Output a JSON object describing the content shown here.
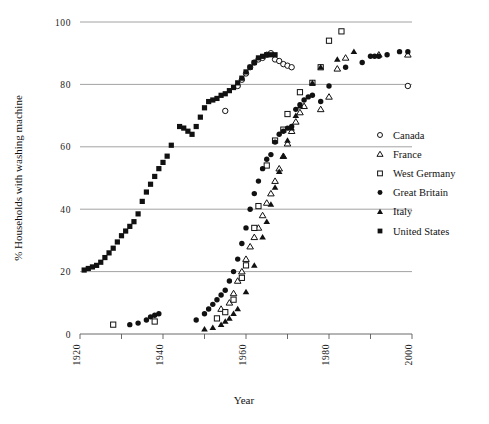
{
  "chart_data": {
    "type": "scatter",
    "title": "",
    "xlabel": "Year",
    "ylabel": "% Households with washing machine",
    "xlim": [
      1920,
      2000
    ],
    "ylim": [
      0,
      100
    ],
    "xticks": [
      1920,
      1940,
      1960,
      1980,
      2000
    ],
    "xtick_labels": [
      "1920",
      "1940",
      "1960",
      "1980",
      "2000"
    ],
    "yticks": [
      0,
      20,
      40,
      60,
      80,
      100
    ],
    "ytick_labels": [
      "0",
      "20",
      "40",
      "60",
      "80",
      "100"
    ],
    "grid": "horizontal",
    "legend_position": "right-middle",
    "series": [
      {
        "name": "Canada",
        "marker": "open-circle",
        "color": "#111111",
        "points": [
          [
            1955,
            71.5
          ],
          [
            1958,
            79.5
          ],
          [
            1959,
            81.5
          ],
          [
            1960,
            83.5
          ],
          [
            1961,
            85.5
          ],
          [
            1962,
            87.0
          ],
          [
            1963,
            88.0
          ],
          [
            1964,
            88.5
          ],
          [
            1965,
            89.5
          ],
          [
            1966,
            90.0
          ],
          [
            1967,
            88.0
          ],
          [
            1968,
            87.5
          ],
          [
            1969,
            86.5
          ],
          [
            1970,
            86.0
          ],
          [
            1971,
            85.5
          ],
          [
            1999,
            79.5
          ]
        ]
      },
      {
        "name": "France",
        "marker": "open-triangle",
        "color": "#111111",
        "points": [
          [
            1954,
            8.0
          ],
          [
            1956,
            10.0
          ],
          [
            1957,
            13.0
          ],
          [
            1958,
            17.0
          ],
          [
            1959,
            20.0
          ],
          [
            1960,
            24.0
          ],
          [
            1961,
            28.0
          ],
          [
            1962,
            31.0
          ],
          [
            1963,
            34.0
          ],
          [
            1964,
            38.0
          ],
          [
            1965,
            42.0
          ],
          [
            1966,
            45.0
          ],
          [
            1967,
            49.0
          ],
          [
            1968,
            53.0
          ],
          [
            1969,
            57.0
          ],
          [
            1970,
            61.0
          ],
          [
            1971,
            65.0
          ],
          [
            1972,
            68.0
          ],
          [
            1973,
            71.0
          ],
          [
            1974,
            73.0
          ],
          [
            1978,
            72.0
          ],
          [
            1980,
            76.0
          ],
          [
            1982,
            85.0
          ],
          [
            1984,
            88.5
          ],
          [
            1992,
            89.5
          ],
          [
            1999,
            89.5
          ]
        ]
      },
      {
        "name": "West Germany",
        "marker": "open-square",
        "color": "#111111",
        "points": [
          [
            1928,
            3.0
          ],
          [
            1938,
            4.0
          ],
          [
            1953,
            5.0
          ],
          [
            1955,
            7.0
          ],
          [
            1957,
            11.0
          ],
          [
            1959,
            18.0
          ],
          [
            1960,
            22.0
          ],
          [
            1962,
            34.0
          ],
          [
            1963,
            41.0
          ],
          [
            1965,
            54.0
          ],
          [
            1967,
            62.0
          ],
          [
            1969,
            65.5
          ],
          [
            1970,
            70.5
          ],
          [
            1973,
            77.5
          ],
          [
            1976,
            80.5
          ],
          [
            1978,
            85.5
          ],
          [
            1980,
            94.0
          ],
          [
            1983,
            97.0
          ]
        ]
      },
      {
        "name": "Great Britain",
        "marker": "filled-circle",
        "color": "#111111",
        "points": [
          [
            1932,
            3.0
          ],
          [
            1934,
            3.5
          ],
          [
            1936,
            4.5
          ],
          [
            1937,
            5.5
          ],
          [
            1938,
            6.0
          ],
          [
            1939,
            6.5
          ],
          [
            1948,
            4.5
          ],
          [
            1950,
            6.5
          ],
          [
            1951,
            8.0
          ],
          [
            1952,
            9.5
          ],
          [
            1953,
            11.0
          ],
          [
            1954,
            12.5
          ],
          [
            1955,
            14.0
          ],
          [
            1956,
            17.0
          ],
          [
            1957,
            20.0
          ],
          [
            1958,
            24.0
          ],
          [
            1959,
            29.0
          ],
          [
            1960,
            34.0
          ],
          [
            1961,
            40.0
          ],
          [
            1962,
            45.0
          ],
          [
            1963,
            49.0
          ],
          [
            1964,
            53.0
          ],
          [
            1965,
            56.0
          ],
          [
            1966,
            57.5
          ],
          [
            1967,
            61.5
          ],
          [
            1968,
            64.0
          ],
          [
            1969,
            65.0
          ],
          [
            1970,
            66.0
          ],
          [
            1971,
            66.5
          ],
          [
            1972,
            72.0
          ],
          [
            1973,
            73.5
          ],
          [
            1974,
            75.0
          ],
          [
            1975,
            76.0
          ],
          [
            1976,
            76.5
          ],
          [
            1978,
            74.5
          ],
          [
            1980,
            79.5
          ],
          [
            1984,
            85.5
          ],
          [
            1988,
            87.0
          ],
          [
            1990,
            89.0
          ],
          [
            1991,
            89.0
          ],
          [
            1992,
            89.0
          ],
          [
            1994,
            89.5
          ],
          [
            1997,
            90.5
          ],
          [
            1999,
            90.5
          ]
        ]
      },
      {
        "name": "Italy",
        "marker": "filled-triangle",
        "color": "#111111",
        "points": [
          [
            1950,
            1.5
          ],
          [
            1952,
            2.0
          ],
          [
            1954,
            3.0
          ],
          [
            1955,
            4.0
          ],
          [
            1956,
            5.0
          ],
          [
            1957,
            6.5
          ],
          [
            1958,
            8.0
          ],
          [
            1960,
            13.5
          ],
          [
            1962,
            22.0
          ],
          [
            1964,
            31.0
          ],
          [
            1965,
            36.0
          ],
          [
            1966,
            41.5
          ],
          [
            1967,
            47.0
          ],
          [
            1968,
            52.0
          ],
          [
            1969,
            57.0
          ],
          [
            1970,
            62.0
          ],
          [
            1971,
            66.0
          ],
          [
            1972,
            70.0
          ],
          [
            1973,
            73.0
          ],
          [
            1976,
            80.5
          ],
          [
            1978,
            85.5
          ],
          [
            1982,
            88.0
          ],
          [
            1986,
            90.5
          ]
        ]
      },
      {
        "name": "United States",
        "marker": "filled-square",
        "color": "#111111",
        "points": [
          [
            1921,
            20.5
          ],
          [
            1922,
            21.0
          ],
          [
            1923,
            21.5
          ],
          [
            1924,
            22.0
          ],
          [
            1925,
            23.0
          ],
          [
            1926,
            24.5
          ],
          [
            1927,
            26.0
          ],
          [
            1928,
            27.5
          ],
          [
            1929,
            29.5
          ],
          [
            1930,
            31.5
          ],
          [
            1931,
            33.0
          ],
          [
            1932,
            34.5
          ],
          [
            1933,
            36.0
          ],
          [
            1934,
            38.5
          ],
          [
            1935,
            42.5
          ],
          [
            1936,
            45.5
          ],
          [
            1937,
            48.0
          ],
          [
            1938,
            50.5
          ],
          [
            1939,
            53.0
          ],
          [
            1940,
            55.0
          ],
          [
            1941,
            57.0
          ],
          [
            1942,
            60.5
          ],
          [
            1944,
            66.5
          ],
          [
            1945,
            66.0
          ],
          [
            1946,
            65.0
          ],
          [
            1947,
            64.0
          ],
          [
            1948,
            66.5
          ],
          [
            1949,
            69.5
          ],
          [
            1950,
            72.5
          ],
          [
            1951,
            74.5
          ],
          [
            1952,
            75.0
          ],
          [
            1953,
            75.5
          ],
          [
            1954,
            76.5
          ],
          [
            1955,
            77.0
          ],
          [
            1956,
            78.0
          ],
          [
            1957,
            79.0
          ],
          [
            1958,
            80.5
          ],
          [
            1959,
            82.0
          ],
          [
            1960,
            84.0
          ],
          [
            1961,
            85.5
          ],
          [
            1962,
            87.0
          ],
          [
            1963,
            88.5
          ],
          [
            1964,
            89.0
          ],
          [
            1965,
            89.5
          ],
          [
            1966,
            89.5
          ],
          [
            1967,
            89.5
          ]
        ]
      }
    ]
  },
  "legend": {
    "items": [
      {
        "label": "Canada",
        "marker": "open-circle"
      },
      {
        "label": "France",
        "marker": "open-triangle"
      },
      {
        "label": "West Germany",
        "marker": "open-square"
      },
      {
        "label": "Great Britain",
        "marker": "filled-circle"
      },
      {
        "label": "Italy",
        "marker": "filled-triangle"
      },
      {
        "label": "United States",
        "marker": "filled-square"
      }
    ]
  },
  "colors": {
    "ink": "#111111",
    "grid": "#8a8a8a",
    "background": "#ffffff"
  }
}
